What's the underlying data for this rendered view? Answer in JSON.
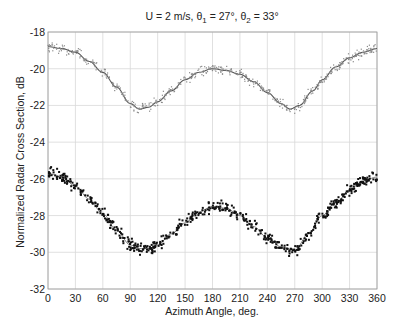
{
  "chart_data": {
    "type": "scatter",
    "title": "U = 2 m/s, θ1 = 27°, θ2 = 33°",
    "title_parts": {
      "prefix": "U = 2 m/s, θ",
      "sub1": "1",
      "mid": " = 27°, θ",
      "sub2": "2",
      "suffix": " = 33°"
    },
    "xlabel": "Azimuth Angle, deg.",
    "ylabel": "Normalized Radar Cross Section, dB",
    "xlim": [
      0,
      360
    ],
    "ylim": [
      -32,
      -18
    ],
    "xticks": [
      0,
      30,
      60,
      90,
      120,
      150,
      180,
      210,
      240,
      270,
      300,
      330,
      360
    ],
    "yticks": [
      -32,
      -30,
      -28,
      -26,
      -24,
      -22,
      -20,
      -18
    ],
    "grid": true,
    "legend": null,
    "series": [
      {
        "name": "upper (light gray points with fit line)",
        "marker_color": "#8a8a8a",
        "line_color": "#555555",
        "x": [
          0,
          15,
          30,
          45,
          60,
          75,
          90,
          100,
          110,
          120,
          135,
          150,
          165,
          180,
          195,
          210,
          225,
          240,
          255,
          265,
          275,
          290,
          300,
          315,
          330,
          345,
          360
        ],
        "values": [
          -18.8,
          -18.9,
          -19.1,
          -19.6,
          -20.2,
          -21.0,
          -21.9,
          -22.2,
          -22.1,
          -21.8,
          -21.2,
          -20.6,
          -20.2,
          -20.0,
          -20.1,
          -20.3,
          -20.7,
          -21.3,
          -21.9,
          -22.2,
          -22.0,
          -21.2,
          -20.6,
          -19.9,
          -19.4,
          -19.1,
          -18.9
        ]
      },
      {
        "name": "lower (black points with fit line)",
        "marker_color": "#111111",
        "line_color": "#777777",
        "x": [
          0,
          15,
          30,
          45,
          60,
          75,
          90,
          100,
          110,
          120,
          135,
          150,
          165,
          180,
          195,
          210,
          225,
          240,
          255,
          270,
          285,
          300,
          315,
          330,
          345,
          360
        ],
        "values": [
          -25.7,
          -25.9,
          -26.4,
          -27.1,
          -27.9,
          -28.8,
          -29.6,
          -29.8,
          -29.8,
          -29.6,
          -29.0,
          -28.4,
          -27.8,
          -27.5,
          -27.6,
          -28.0,
          -28.6,
          -29.2,
          -29.7,
          -29.9,
          -29.0,
          -28.0,
          -27.3,
          -26.6,
          -26.1,
          -25.9
        ]
      }
    ]
  },
  "plot_box": {
    "left": 48,
    "right": 377,
    "top": 32,
    "bottom": 289
  }
}
